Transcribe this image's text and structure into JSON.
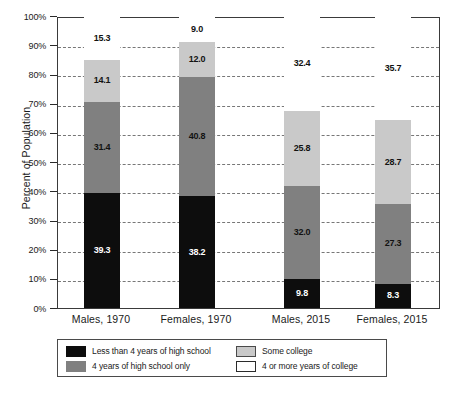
{
  "chart_data": {
    "type": "bar",
    "subtype": "stacked-bar-100-percent",
    "title": "",
    "xlabel": "",
    "ylabel": "Percent of Population",
    "ylim": [
      0,
      100
    ],
    "ytick_labels": [
      "0%",
      "10%",
      "20%",
      "30%",
      "40%",
      "50%",
      "60%",
      "70%",
      "80%",
      "90%",
      "100%"
    ],
    "ytick_values": [
      0,
      10,
      20,
      30,
      40,
      50,
      60,
      70,
      80,
      90,
      100
    ],
    "grid": true,
    "grid_style": "dashed-horizontal",
    "legend_position": "below-axes",
    "categories": [
      "Males, 1970",
      "Females, 1970",
      "Males, 2015",
      "Females, 2015"
    ],
    "series": [
      {
        "name": "Less than 4 years of high school",
        "color": "#0d0d0d",
        "values": [
          39.3,
          38.2,
          9.8,
          8.3
        ]
      },
      {
        "name": "4 years of high school only",
        "color": "#808080",
        "values": [
          31.4,
          40.8,
          32.0,
          27.3
        ]
      },
      {
        "name": "Some college",
        "color": "#c9c9c9",
        "values": [
          14.1,
          12.0,
          25.8,
          28.7
        ]
      },
      {
        "name": "4 or more years of college",
        "color": "#ffffff",
        "values": [
          15.3,
          9.0,
          32.4,
          35.7
        ]
      }
    ],
    "bar_labels": [
      [
        "39.3",
        "31.4",
        "14.1",
        "15.3"
      ],
      [
        "38.2",
        "40.8",
        "12.0",
        "9.0"
      ],
      [
        "9.8",
        "32.0",
        "25.8",
        "32.4"
      ],
      [
        "8.3",
        "27.3",
        "28.7",
        "35.7"
      ]
    ]
  },
  "legend": {
    "items": [
      {
        "label": "Less than 4 years of high school",
        "swatch": "k0"
      },
      {
        "label": "Some college",
        "swatch": "k2"
      },
      {
        "label": "4 years of high school only",
        "swatch": "k1"
      },
      {
        "label": "4 or more years of college",
        "swatch": "k3"
      }
    ]
  }
}
